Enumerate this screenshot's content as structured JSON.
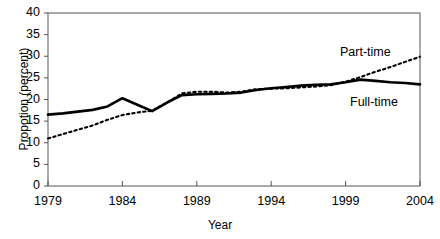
{
  "chart_data": {
    "type": "line",
    "title": "",
    "xlabel": "Year",
    "ylabel": "Propotion (percent)",
    "xlim": [
      1979,
      2004
    ],
    "ylim": [
      0,
      40
    ],
    "ytick_values": [
      0,
      5,
      10,
      15,
      20,
      25,
      30,
      35,
      40
    ],
    "ytick_labels": [
      "0",
      "5",
      "10",
      "15",
      "20",
      "25",
      "30",
      "35",
      "40"
    ],
    "xtick_values": [
      1979,
      1984,
      1989,
      1994,
      1999,
      2004
    ],
    "xtick_labels": [
      "1979",
      "1984",
      "1989",
      "1994",
      "1999",
      "2004"
    ],
    "grid": false,
    "legend": "inline-annotations",
    "x": [
      1979,
      1980,
      1981,
      1982,
      1983,
      1984,
      1985,
      1986,
      1987,
      1988,
      1989,
      1990,
      1991,
      1992,
      1993,
      1994,
      1995,
      1996,
      1997,
      1998,
      1999,
      2000,
      2001,
      2002,
      2003,
      2004
    ],
    "series": [
      {
        "name": "Full-time",
        "style": "solid",
        "color": "#000000",
        "label_position": "inside-right-lower",
        "values": [
          16.5,
          16.8,
          17.2,
          17.6,
          18.4,
          20.3,
          18.8,
          17.3,
          19.3,
          21.0,
          21.2,
          21.3,
          21.4,
          21.6,
          22.2,
          22.6,
          22.9,
          23.2,
          23.4,
          23.5,
          24.0,
          24.6,
          24.3,
          24.0,
          23.8,
          23.5
        ]
      },
      {
        "name": "Part-time",
        "style": "dashed",
        "color": "#000000",
        "label_position": "inside-right-upper",
        "values": [
          11.0,
          12.0,
          13.0,
          14.0,
          15.3,
          16.4,
          17.0,
          17.4,
          19.3,
          21.4,
          21.8,
          21.8,
          21.6,
          21.8,
          22.4,
          22.5,
          22.6,
          22.8,
          23.0,
          23.3,
          24.1,
          25.2,
          26.4,
          27.5,
          28.7,
          29.9
        ]
      }
    ],
    "axis_color": "#555555",
    "frame": {
      "left": true,
      "bottom": true,
      "top": true,
      "right": true
    }
  }
}
